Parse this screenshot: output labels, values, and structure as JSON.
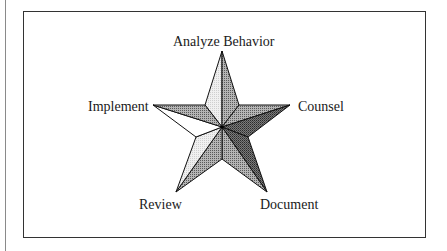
{
  "diagram": {
    "type": "five-point-star",
    "points": [
      {
        "label": "Analyze Behavior",
        "position": "top"
      },
      {
        "label": "Counsel",
        "position": "right"
      },
      {
        "label": "Document",
        "position": "bottom-right"
      },
      {
        "label": "Review",
        "position": "bottom-left"
      },
      {
        "label": "Implement",
        "position": "left"
      }
    ],
    "colors": {
      "light": "#e6e6e6",
      "medium": "#9a9a9a",
      "dark": "#6a6a6a",
      "outline": "#111111"
    }
  }
}
